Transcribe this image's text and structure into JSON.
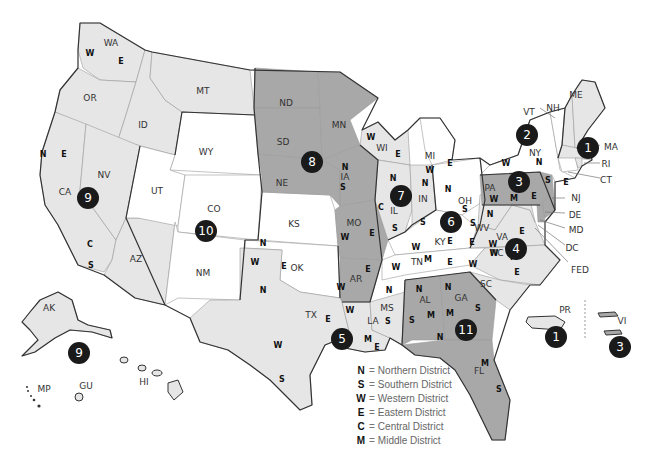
{
  "map": {
    "title": "U.S. Federal Judicial Circuits and Districts",
    "colors": {
      "white": "#ffffff",
      "light_gray": "#e6e6e6",
      "dark_gray": "#a8a8a8",
      "circuit_badge": "#1a1a1a",
      "outline": "#333333"
    },
    "states": {
      "WA": "WA",
      "OR": "OR",
      "ID": "ID",
      "MT": "MT",
      "WY": "WY",
      "CA": "CA",
      "NV": "NV",
      "UT": "UT",
      "CO": "CO",
      "AZ": "AZ",
      "NM": "NM",
      "ND": "ND",
      "SD": "SD",
      "NE": "NE",
      "KS": "KS",
      "OK": "OK",
      "TX": "TX",
      "MN": "MN",
      "IA": "IA",
      "MO": "MO",
      "AR": "AR",
      "LA": "LA",
      "WI": "WI",
      "IL": "IL",
      "MI": "MI",
      "IN": "IN",
      "OH": "OH",
      "KY": "KY",
      "TN": "TN",
      "MS": "MS",
      "AL": "AL",
      "GA": "GA",
      "FL": "FL",
      "SC": "SC",
      "NC": "NC",
      "VA": "VA",
      "WV": "WV",
      "PA": "PA",
      "NY": "NY",
      "VT": "VT",
      "NH": "NH",
      "ME": "ME",
      "MA": "MA",
      "RI": "RI",
      "CT": "CT",
      "NJ": "NJ",
      "DE": "DE",
      "MD": "MD",
      "DC": "DC",
      "FED": "FED",
      "AK": "AK",
      "HI": "HI",
      "GU": "GU",
      "MP": "MP",
      "PR": "PR",
      "VI": "VI"
    },
    "circuits": {
      "c1_main": "1",
      "c1_pr": "1",
      "c2": "2",
      "c3_main": "3",
      "c3_vi": "3",
      "c4": "4",
      "c5": "5",
      "c6": "6",
      "c7": "7",
      "c8": "8",
      "c9_main": "9",
      "c9_ak": "9",
      "c10": "10",
      "c11": "11"
    },
    "district_letters": {
      "N": "N",
      "S": "S",
      "W": "W",
      "E": "E",
      "C": "C",
      "M": "M"
    }
  },
  "legend": {
    "items": [
      {
        "key": "N",
        "eq": "=",
        "label": "Northern District"
      },
      {
        "key": "S",
        "eq": "=",
        "label": "Southern District"
      },
      {
        "key": "W",
        "eq": "=",
        "label": "Western District"
      },
      {
        "key": "E",
        "eq": "=",
        "label": "Eastern District"
      },
      {
        "key": "C",
        "eq": "=",
        "label": "Central District"
      },
      {
        "key": "M",
        "eq": "=",
        "label": "Middle District"
      }
    ]
  }
}
